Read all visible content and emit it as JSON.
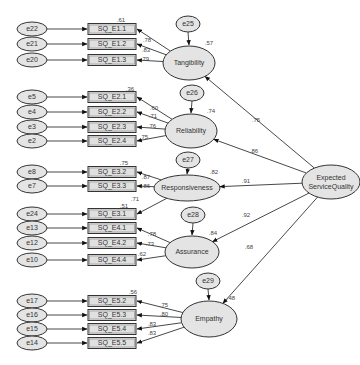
{
  "diagram": {
    "type": "structural-equation-model",
    "second_order": {
      "id": "esq",
      "label_line1": "Expected",
      "label_line2": "ServiceQuality",
      "cx": 331,
      "cy": 182,
      "rx": 29,
      "ry": 17
    },
    "factors": [
      {
        "id": "tan",
        "label": "Tangibility",
        "cx": 189,
        "cy": 63,
        "rx": 26,
        "ry": 17,
        "r2": ".57",
        "error": "e25",
        "ecx": 188,
        "ecy": 24,
        "path": ".75",
        "path_x": 256,
        "path_y": 120
      },
      {
        "id": "rel",
        "label": "Reliability",
        "cx": 191,
        "cy": 131,
        "rx": 26,
        "ry": 17,
        "r2": ".74",
        "error": "e26",
        "ecx": 192,
        "ecy": 93,
        "path": ".86",
        "path_x": 254,
        "path_y": 151
      },
      {
        "id": "res",
        "label": "Responsiveness",
        "cx": 187,
        "cy": 188,
        "rx": 33,
        "ry": 13,
        "r2": ".82",
        "error": "e27",
        "ecx": 188,
        "ecy": 160,
        "path": ".91",
        "path_x": 246,
        "path_y": 181
      },
      {
        "id": "ass",
        "label": "Assurance",
        "cx": 192,
        "cy": 252,
        "rx": 27,
        "ry": 16,
        "r2": ".84",
        "error": "e28",
        "ecx": 193,
        "ecy": 215,
        "path": ".92",
        "path_x": 246,
        "path_y": 215
      },
      {
        "id": "emp",
        "label": "Empathy",
        "cx": 209,
        "cy": 319,
        "rx": 28,
        "ry": 18,
        "r2": ".48",
        "error": "e29",
        "ecx": 208,
        "ecy": 281,
        "path": ".68",
        "path_x": 249,
        "path_y": 247
      }
    ],
    "indicators": [
      {
        "label": "SQ_E1.1",
        "error": "e22",
        "y": 29,
        "factor": "tan",
        "loading": ".78",
        "lx": 147,
        "ly": 40,
        "r2": ".61",
        "r2x": 121,
        "r2y": 20
      },
      {
        "label": "SQ_E1.2",
        "error": "e21",
        "y": 44,
        "factor": "tan",
        "loading": ".83",
        "lx": 146,
        "ly": 50,
        "r2": "",
        "r2x": 0,
        "r2y": 0
      },
      {
        "label": "SQ_E1.3",
        "error": "e20",
        "y": 60,
        "factor": "tan",
        "loading": ".79",
        "lx": 145,
        "ly": 59,
        "r2": "",
        "r2x": 0,
        "r2y": 0
      },
      {
        "label": "SQ_E2.1",
        "error": "e5",
        "y": 97,
        "factor": "rel",
        "loading": ".60",
        "lx": 154,
        "ly": 108,
        "r2": ".36",
        "r2x": 130,
        "r2y": 89
      },
      {
        "label": "SQ_E2.2",
        "error": "e4",
        "y": 112,
        "factor": "rel",
        "loading": ".71",
        "lx": 153,
        "ly": 116,
        "r2": "",
        "r2x": 0,
        "r2y": 0
      },
      {
        "label": "SQ_E2.3",
        "error": "e3",
        "y": 127,
        "factor": "rel",
        "loading": ".76",
        "lx": 152,
        "ly": 126,
        "r2": "",
        "r2x": 0,
        "r2y": 0
      },
      {
        "label": "SQ_E2.4",
        "error": "e2",
        "y": 141,
        "factor": "rel",
        "loading": ".75",
        "lx": 144,
        "ly": 137,
        "r2": "",
        "r2x": 0,
        "r2y": 0
      },
      {
        "label": "SQ_E3.2",
        "error": "e8",
        "y": 172,
        "factor": "res",
        "loading": ".87",
        "lx": 146,
        "ly": 177,
        "r2": ".75",
        "r2x": 124,
        "r2y": 163
      },
      {
        "label": "SQ_E3.3",
        "error": "e7",
        "y": 186,
        "factor": "res",
        "loading": ".86",
        "lx": 146,
        "ly": 186,
        "r2": "",
        "r2x": 0,
        "r2y": 0
      },
      {
        "label": "SQ_E3.1",
        "error": "e24",
        "y": 214,
        "factor": "res",
        "loading": ".71",
        "lx": 135,
        "ly": 199,
        "r2": ".51",
        "r2x": 124,
        "r2y": 206
      },
      {
        "label": "SQ_E4.1",
        "error": "e13",
        "y": 228,
        "factor": "ass",
        "loading": ".78",
        "lx": 152,
        "ly": 234,
        "r2": "",
        "r2x": 0,
        "r2y": 0
      },
      {
        "label": "SQ_E4.2",
        "error": "e12",
        "y": 243,
        "factor": "ass",
        "loading": ".73",
        "lx": 150,
        "ly": 244,
        "r2": "",
        "r2x": 0,
        "r2y": 0
      },
      {
        "label": "SQ_E4.4",
        "error": "e10",
        "y": 260,
        "factor": "ass",
        "loading": ".62",
        "lx": 142,
        "ly": 254,
        "r2": "",
        "r2x": 0,
        "r2y": 0
      },
      {
        "label": "SQ_E5.2",
        "error": "e17",
        "y": 301,
        "factor": "emp",
        "loading": ".75",
        "lx": 164,
        "ly": 305,
        "r2": ".56",
        "r2x": 133,
        "r2y": 292
      },
      {
        "label": "SQ_E5.3",
        "error": "e16",
        "y": 315,
        "factor": "emp",
        "loading": ".80",
        "lx": 164,
        "ly": 314,
        "r2": "",
        "r2x": 0,
        "r2y": 0
      },
      {
        "label": "SQ_E5.4",
        "error": "e15",
        "y": 329,
        "factor": "emp",
        "loading": ".83",
        "lx": 152,
        "ly": 324,
        "r2": "",
        "r2x": 0,
        "r2y": 0
      },
      {
        "label": "SQ_E5.5",
        "error": "e14",
        "y": 343,
        "factor": "emp",
        "loading": ".83",
        "lx": 152,
        "ly": 333,
        "r2": "",
        "r2x": 0,
        "r2y": 0
      }
    ],
    "colors": {
      "fill": "#e4e4e4",
      "stroke": "#333333",
      "background": "#ffffff"
    }
  }
}
